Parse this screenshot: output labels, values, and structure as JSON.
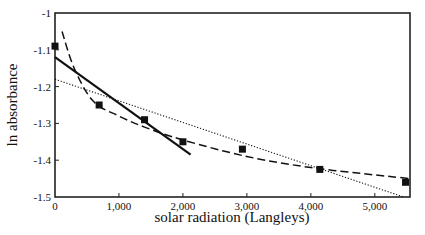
{
  "chart_data": {
    "type": "scatter",
    "title": "",
    "xlabel": "solar radiation (Langleys)",
    "ylabel": "ln absorbance",
    "xlim": [
      0,
      5550
    ],
    "ylim": [
      -1.5,
      -1.0
    ],
    "grid": false,
    "legend": null,
    "x_ticks": [
      0,
      1000,
      2000,
      3000,
      4000,
      5000
    ],
    "x_tick_labels": [
      "0",
      "1,000",
      "2,000",
      "3,000",
      "4,000",
      "5,000"
    ],
    "y_ticks": [
      -1.0,
      -1.1,
      -1.2,
      -1.3,
      -1.4,
      -1.5
    ],
    "y_tick_labels": [
      "-1",
      "-1.1",
      "-1.2",
      "-1.3",
      "-1.4",
      "-1.5"
    ],
    "series": [
      {
        "name": "observed",
        "style": "square-markers",
        "x": [
          0,
          690,
          1400,
          2000,
          2930,
          4140,
          5480
        ],
        "y": [
          -1.09,
          -1.25,
          -1.29,
          -1.35,
          -1.37,
          -1.425,
          -1.46
        ]
      },
      {
        "name": "linear fit (early)",
        "style": "solid",
        "x": [
          0,
          2120
        ],
        "y": [
          -1.12,
          -1.385
        ]
      },
      {
        "name": "linear fit (all)",
        "style": "dotted",
        "x": [
          0,
          5450
        ],
        "y": [
          -1.18,
          -1.5
        ]
      },
      {
        "name": "curved fit",
        "style": "dashed",
        "x": [
          110,
          300,
          600,
          1000,
          1400,
          2000,
          3000,
          4000,
          5000,
          5550
        ],
        "y": [
          -1.05,
          -1.15,
          -1.24,
          -1.28,
          -1.31,
          -1.345,
          -1.39,
          -1.42,
          -1.44,
          -1.45
        ]
      }
    ]
  }
}
